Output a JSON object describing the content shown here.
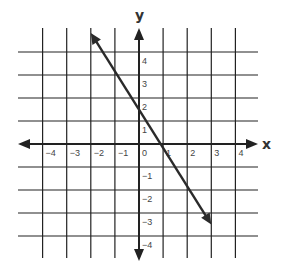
{
  "chart_data": {
    "type": "line",
    "title": "",
    "xlabel": "x",
    "ylabel": "y",
    "xlim": [
      -5,
      5
    ],
    "ylim": [
      -5,
      5
    ],
    "grid": true,
    "x_ticks": [
      -4,
      -3,
      -2,
      -1,
      0,
      1,
      2,
      3,
      4
    ],
    "y_ticks": [
      4,
      3,
      2,
      1,
      -1,
      -2,
      -3,
      -4
    ],
    "x_tick_labels": [
      "−4",
      "−3",
      "−2",
      "−1",
      "0",
      "1",
      "2",
      "3",
      "4"
    ],
    "y_tick_labels": [
      "4",
      "3",
      "2",
      "1",
      "−1",
      "−2",
      "−3",
      "−4"
    ],
    "series": [
      {
        "name": "line",
        "equation": "y = -(5/3)x + 1.5",
        "slope": -1.667,
        "y_intercept": 1.5,
        "x_intercept": 0.9,
        "x": [
          -2,
          3
        ],
        "y": [
          4.83,
          -3.5
        ],
        "arrows": "both ends"
      }
    ],
    "legend": null
  },
  "colors": {
    "background": "#ffffff",
    "grid": "#222222",
    "axis": "#222222",
    "line": "#2a2a2a",
    "text": "#444444"
  }
}
